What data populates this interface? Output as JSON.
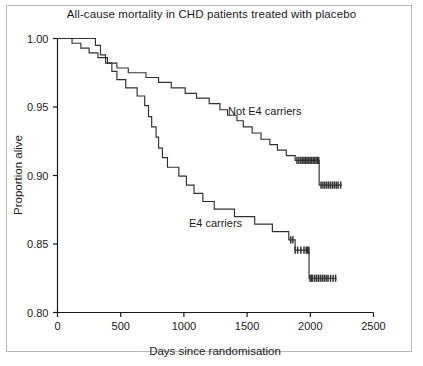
{
  "chart_data": {
    "type": "line",
    "subtype": "kaplan-meier-step",
    "title": "All-cause mortality in CHD patients treated with placebo",
    "xlabel": "Days since randomisation",
    "ylabel": "Proportion alive",
    "xlim": [
      0,
      2500
    ],
    "ylim": [
      0.8,
      1.0
    ],
    "xticks": [
      0,
      500,
      1000,
      1500,
      2000,
      2500
    ],
    "xtick_labels": [
      "0",
      "500",
      "1000",
      "1500",
      "2000",
      "2500"
    ],
    "yticks": [
      0.8,
      0.85,
      0.9,
      0.95,
      1.0
    ],
    "ytick_labels": [
      "0.80",
      "0.85",
      "0.90",
      "0.95",
      "1.00"
    ],
    "grid": false,
    "legend_position": "inline-annotation",
    "line_color": "#303030",
    "series": [
      {
        "name": "Not E4 carriers",
        "label": "Not E4 carriers",
        "label_x": 1640,
        "label_y": 0.9445,
        "final_value": 0.893,
        "points": [
          [
            0,
            1.0
          ],
          [
            115,
            1.0
          ],
          [
            115,
            0.9965
          ],
          [
            185,
            0.9965
          ],
          [
            185,
            0.993
          ],
          [
            250,
            0.993
          ],
          [
            250,
            0.9895
          ],
          [
            320,
            0.9895
          ],
          [
            320,
            0.986
          ],
          [
            395,
            0.986
          ],
          [
            395,
            0.982
          ],
          [
            470,
            0.982
          ],
          [
            470,
            0.9785
          ],
          [
            560,
            0.9785
          ],
          [
            560,
            0.975
          ],
          [
            700,
            0.975
          ],
          [
            700,
            0.9715
          ],
          [
            800,
            0.9715
          ],
          [
            800,
            0.968
          ],
          [
            900,
            0.968
          ],
          [
            900,
            0.964
          ],
          [
            1010,
            0.964
          ],
          [
            1010,
            0.96
          ],
          [
            1100,
            0.96
          ],
          [
            1100,
            0.9565
          ],
          [
            1200,
            0.9565
          ],
          [
            1200,
            0.9525
          ],
          [
            1285,
            0.9525
          ],
          [
            1285,
            0.948
          ],
          [
            1345,
            0.948
          ],
          [
            1345,
            0.944
          ],
          [
            1420,
            0.944
          ],
          [
            1420,
            0.94
          ],
          [
            1470,
            0.94
          ],
          [
            1470,
            0.9355
          ],
          [
            1540,
            0.9355
          ],
          [
            1540,
            0.931
          ],
          [
            1610,
            0.931
          ],
          [
            1610,
            0.9265
          ],
          [
            1680,
            0.9265
          ],
          [
            1680,
            0.9225
          ],
          [
            1740,
            0.9225
          ],
          [
            1740,
            0.9185
          ],
          [
            1810,
            0.9185
          ],
          [
            1810,
            0.9145
          ],
          [
            1880,
            0.9145
          ],
          [
            1880,
            0.911
          ],
          [
            2070,
            0.911
          ],
          [
            2070,
            0.893
          ],
          [
            2250,
            0.893
          ]
        ],
        "censor_marks": [
          1895,
          1910,
          1925,
          1938,
          1950,
          1962,
          1974,
          1986,
          1998,
          2010,
          2022,
          2034,
          2046,
          2058,
          2066,
          2085,
          2100,
          2115,
          2130,
          2145,
          2160,
          2175,
          2190,
          2205,
          2220,
          2240
        ]
      },
      {
        "name": "E4 carriers",
        "label": "E4 carriers",
        "label_x": 1250,
        "label_y": 0.8625,
        "final_value": 0.825,
        "points": [
          [
            0,
            1.0
          ],
          [
            300,
            1.0
          ],
          [
            300,
            0.995
          ],
          [
            340,
            0.995
          ],
          [
            340,
            0.988
          ],
          [
            380,
            0.988
          ],
          [
            380,
            0.982
          ],
          [
            430,
            0.982
          ],
          [
            430,
            0.976
          ],
          [
            470,
            0.976
          ],
          [
            470,
            0.97
          ],
          [
            540,
            0.97
          ],
          [
            540,
            0.964
          ],
          [
            630,
            0.964
          ],
          [
            630,
            0.958
          ],
          [
            690,
            0.958
          ],
          [
            690,
            0.951
          ],
          [
            720,
            0.951
          ],
          [
            720,
            0.943
          ],
          [
            745,
            0.943
          ],
          [
            745,
            0.9355
          ],
          [
            780,
            0.9355
          ],
          [
            780,
            0.928
          ],
          [
            800,
            0.928
          ],
          [
            800,
            0.92
          ],
          [
            830,
            0.92
          ],
          [
            830,
            0.913
          ],
          [
            870,
            0.913
          ],
          [
            870,
            0.906
          ],
          [
            960,
            0.906
          ],
          [
            960,
            0.8995
          ],
          [
            1020,
            0.8995
          ],
          [
            1020,
            0.893
          ],
          [
            1080,
            0.893
          ],
          [
            1080,
            0.887
          ],
          [
            1150,
            0.887
          ],
          [
            1150,
            0.881
          ],
          [
            1240,
            0.881
          ],
          [
            1240,
            0.8755
          ],
          [
            1400,
            0.8755
          ],
          [
            1400,
            0.87
          ],
          [
            1560,
            0.87
          ],
          [
            1560,
            0.8645
          ],
          [
            1700,
            0.8645
          ],
          [
            1700,
            0.859
          ],
          [
            1830,
            0.859
          ],
          [
            1830,
            0.853
          ],
          [
            1880,
            0.853
          ],
          [
            1880,
            0.8455
          ],
          [
            1990,
            0.8455
          ],
          [
            1990,
            0.825
          ],
          [
            2210,
            0.825
          ]
        ],
        "censor_marks": [
          1845,
          1862,
          1880,
          1900,
          1925,
          1950,
          1968,
          1978,
          1988,
          1998,
          2008,
          2018,
          2035,
          2050,
          2065,
          2080,
          2095,
          2110,
          2125,
          2140,
          2160,
          2180,
          2200
        ]
      }
    ]
  }
}
